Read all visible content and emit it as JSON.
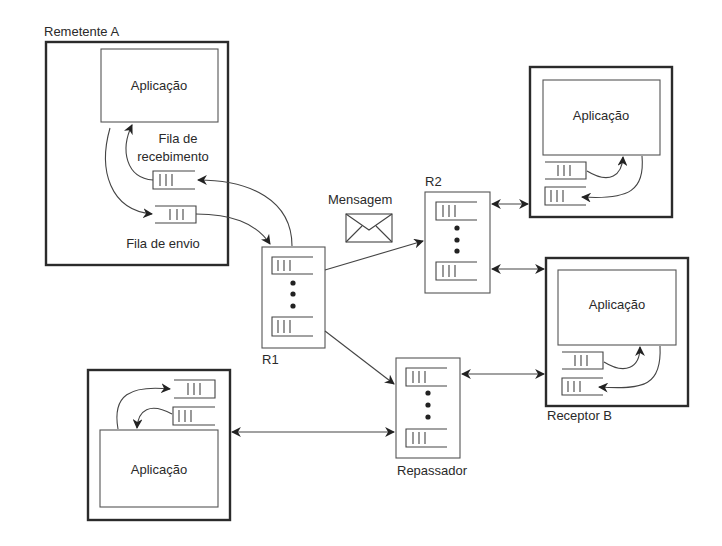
{
  "diagram": {
    "sender": {
      "label": "Remetente A",
      "app_label": "Aplicação",
      "receive_queue_label_line1": "Fila de",
      "receive_queue_label_line2": "recebimento",
      "send_queue_label": "Fila de envio"
    },
    "message_label": "Mensagem",
    "routers": [
      {
        "id": "R1",
        "label": "R1"
      },
      {
        "id": "R2",
        "label": "R2"
      },
      {
        "id": "relay",
        "label": "Repassador"
      }
    ],
    "top_right_host": {
      "app_label": "Aplicação"
    },
    "receiver": {
      "label": "Receptor B",
      "app_label": "Aplicação"
    },
    "bottom_left_host": {
      "app_label": "Aplicação"
    },
    "colors": {
      "stroke": "#2b2b2b",
      "background": "#ffffff"
    }
  }
}
